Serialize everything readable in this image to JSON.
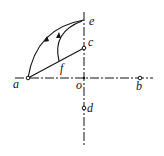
{
  "diagram": {
    "labels": {
      "a": "a",
      "b": "b",
      "c": "c",
      "d": "d",
      "e": "e",
      "f": "f",
      "o": "o"
    },
    "colors": {
      "ink": "#111111",
      "background": "#ffffff"
    }
  }
}
